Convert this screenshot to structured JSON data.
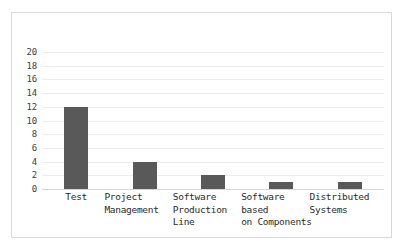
{
  "chart_data": {
    "type": "bar",
    "title": "",
    "subtitle": "",
    "xlabel": "",
    "ylabel": "",
    "categories": [
      "Test",
      "Project Management",
      "Software Production Line",
      "Software based on Components",
      "Distributed Systems"
    ],
    "values": [
      12,
      4,
      2,
      1,
      1
    ],
    "ylim": [
      0,
      20
    ],
    "ytick_step": 2,
    "yticks": [
      0,
      2,
      4,
      6,
      8,
      10,
      12,
      14,
      16,
      18,
      20
    ],
    "ytick_labels": [
      "0",
      "2",
      "4",
      "6",
      "8",
      "10",
      "12",
      "14",
      "16",
      "18",
      "20"
    ],
    "grid": "horizontal",
    "legend": "none",
    "series": [
      {
        "name": "",
        "values": [
          12,
          4,
          2,
          1,
          1
        ]
      }
    ],
    "annotations": []
  },
  "style": {
    "bar_color": "#595959",
    "gridline_color": "#ececec",
    "axis_line_color": "#d6d6d6",
    "frame_border_color": "#d9d9d9",
    "background_color": "#ffffff",
    "tick_label_color": "#404040",
    "category_label_color": "#2b2b2b"
  },
  "category_label_lines": [
    "Test",
    "Project\nManagement",
    "Software\nProduction\nLine",
    "Software\nbased\non Components",
    "Distributed\nSystems"
  ]
}
